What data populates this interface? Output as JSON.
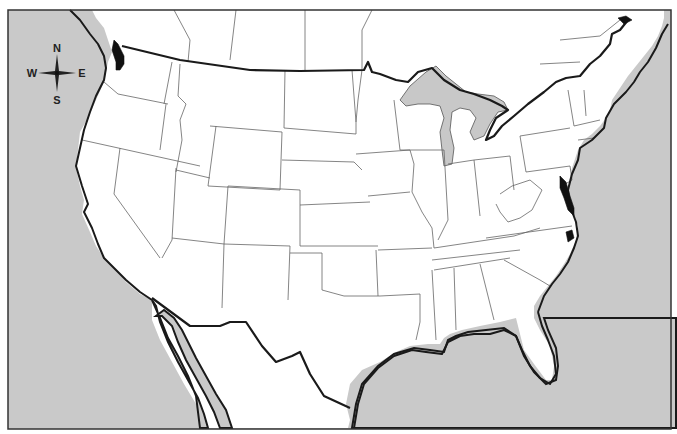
{
  "map": {
    "title": "",
    "type": "blank outline map",
    "region": "United States with southern Canada and northern Mexico",
    "colors": {
      "water": "#c9c9c9",
      "land": "#ffffff",
      "border": "#1a1a1a",
      "state_line": "#555555",
      "great_lakes": "#c8c8c8",
      "bays": "#111111"
    },
    "frame": {
      "x": 8,
      "y": 10,
      "width": 663,
      "height": 419
    }
  },
  "compass": {
    "north": "N",
    "south": "S",
    "east": "E",
    "west": "W"
  }
}
